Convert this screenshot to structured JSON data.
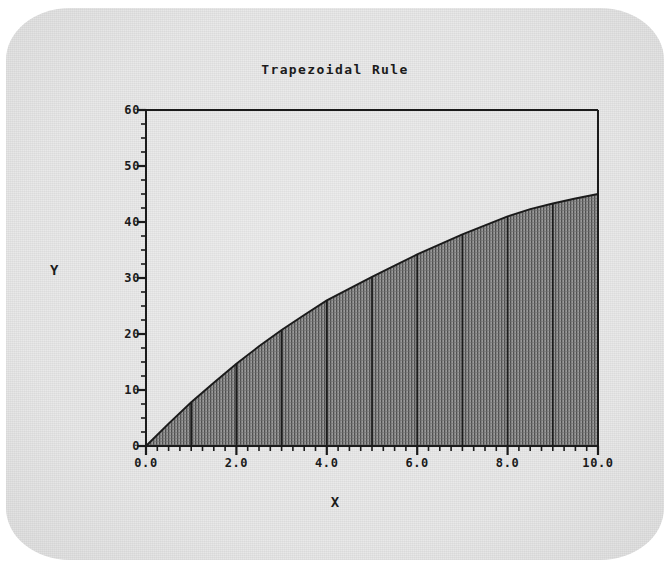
{
  "chart_data": {
    "type": "area",
    "title": "Trapezoidal Rule",
    "xlabel": "X",
    "ylabel": "Y",
    "xlim": [
      0.0,
      10.0
    ],
    "ylim": [
      0,
      60
    ],
    "grid": false,
    "legend": null,
    "x_tick_labels": [
      "0.0",
      "2.0",
      "4.0",
      "6.0",
      "8.0",
      "10.0"
    ],
    "x_tick_values": [
      0.0,
      2.0,
      4.0,
      6.0,
      8.0,
      10.0
    ],
    "x_minor_tick_step": 0.25,
    "y_tick_labels": [
      "0",
      "10",
      "20",
      "30",
      "40",
      "50",
      "60"
    ],
    "y_tick_values": [
      0,
      10,
      20,
      30,
      40,
      50,
      60
    ],
    "y_minor_tick_step": 2.5,
    "curve_label": "f(x)",
    "x": [
      0.0,
      0.5,
      1.0,
      1.5,
      2.0,
      2.5,
      3.0,
      3.5,
      4.0,
      4.5,
      5.0,
      5.5,
      6.0,
      6.5,
      7.0,
      7.5,
      8.0,
      8.5,
      9.0,
      9.5,
      10.0
    ],
    "y": [
      0.0,
      4.0,
      7.8,
      11.3,
      14.7,
      17.8,
      20.7,
      23.4,
      26.0,
      28.1,
      30.2,
      32.2,
      34.2,
      36.0,
      37.8,
      39.4,
      41.0,
      42.3,
      43.3,
      44.2,
      45.0
    ],
    "trapezoid_count": 10,
    "trapezoid_step": 1.0,
    "trapezoid_boundaries": [
      0.0,
      1.0,
      2.0,
      3.0,
      4.0,
      5.0,
      6.0,
      7.0,
      8.0,
      9.0,
      10.0
    ],
    "trapezoid_heights": [
      0.0,
      7.8,
      14.7,
      20.7,
      26.0,
      30.2,
      34.2,
      37.8,
      41.0,
      43.3,
      45.0
    ],
    "fill_pattern": "vertical-hatch",
    "fill_color": "#7d7d7d",
    "line_color": "#1b1b1b",
    "axis_color": "#1b1b1b",
    "background_color": "#e8e8e8"
  },
  "plot_geometry": {
    "left_px": 146,
    "right_px": 598,
    "top_px": 110,
    "bottom_px": 446
  }
}
